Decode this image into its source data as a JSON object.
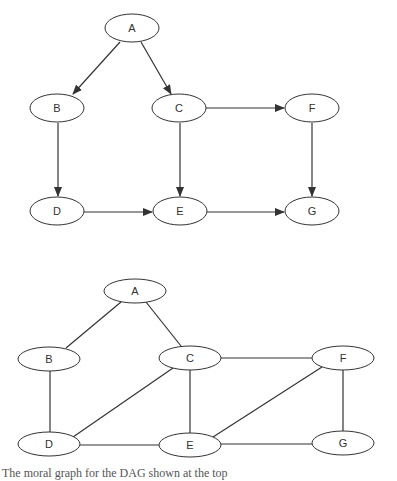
{
  "diagrams": [
    {
      "id": "dag",
      "type": "directed",
      "title": "DAG",
      "nodes": [
        {
          "label": "A",
          "cx": 132,
          "cy": 28,
          "rx": 27,
          "ry": 14
        },
        {
          "label": "B",
          "cx": 57,
          "cy": 108,
          "rx": 27,
          "ry": 14
        },
        {
          "label": "C",
          "cx": 179,
          "cy": 108,
          "rx": 27,
          "ry": 14
        },
        {
          "label": "F",
          "cx": 312,
          "cy": 108,
          "rx": 27,
          "ry": 14
        },
        {
          "label": "D",
          "cx": 57,
          "cy": 211,
          "rx": 27,
          "ry": 14
        },
        {
          "label": "E",
          "cx": 180,
          "cy": 211,
          "rx": 27,
          "ry": 14
        },
        {
          "label": "G",
          "cx": 312,
          "cy": 211,
          "rx": 27,
          "ry": 14
        }
      ],
      "edges": [
        {
          "from": "A",
          "to": "B",
          "x1": 120,
          "y1": 42,
          "x2": 73,
          "y2": 94
        },
        {
          "from": "A",
          "to": "C",
          "x1": 141,
          "y1": 42,
          "x2": 171,
          "y2": 94
        },
        {
          "from": "B",
          "to": "D",
          "x1": 58,
          "y1": 123,
          "x2": 58,
          "y2": 196
        },
        {
          "from": "C",
          "to": "E",
          "x1": 180,
          "y1": 123,
          "x2": 180,
          "y2": 196
        },
        {
          "from": "C",
          "to": "F",
          "x1": 206,
          "y1": 108,
          "x2": 284,
          "y2": 108
        },
        {
          "from": "F",
          "to": "G",
          "x1": 312,
          "y1": 123,
          "x2": 312,
          "y2": 196
        },
        {
          "from": "D",
          "to": "E",
          "x1": 84,
          "y1": 212,
          "x2": 152,
          "y2": 212
        },
        {
          "from": "E",
          "to": "G",
          "x1": 207,
          "y1": 212,
          "x2": 284,
          "y2": 212
        }
      ]
    },
    {
      "id": "moral-graph",
      "type": "undirected",
      "title": "Moral graph",
      "nodes": [
        {
          "label": "A",
          "cx": 135,
          "cy": 291,
          "rx": 31,
          "ry": 12
        },
        {
          "label": "B",
          "cx": 49,
          "cy": 359,
          "rx": 31,
          "ry": 12
        },
        {
          "label": "C",
          "cx": 190,
          "cy": 358,
          "rx": 31,
          "ry": 12
        },
        {
          "label": "F",
          "cx": 343,
          "cy": 358,
          "rx": 31,
          "ry": 12
        },
        {
          "label": "D",
          "cx": 49,
          "cy": 444,
          "rx": 31,
          "ry": 12
        },
        {
          "label": "E",
          "cx": 190,
          "cy": 445,
          "rx": 31,
          "ry": 12
        },
        {
          "label": "G",
          "cx": 343,
          "cy": 443,
          "rx": 31,
          "ry": 12
        }
      ],
      "edges": [
        {
          "from": "A",
          "to": "B",
          "x1": 121,
          "y1": 302,
          "x2": 66,
          "y2": 348
        },
        {
          "from": "A",
          "to": "C",
          "x1": 146,
          "y1": 302,
          "x2": 181,
          "y2": 346
        },
        {
          "from": "B",
          "to": "D",
          "x1": 50,
          "y1": 371,
          "x2": 50,
          "y2": 432
        },
        {
          "from": "C",
          "to": "D",
          "x1": 173,
          "y1": 368,
          "x2": 73,
          "y2": 437
        },
        {
          "from": "C",
          "to": "E",
          "x1": 190,
          "y1": 370,
          "x2": 190,
          "y2": 433
        },
        {
          "from": "C",
          "to": "F",
          "x1": 221,
          "y1": 358,
          "x2": 312,
          "y2": 358
        },
        {
          "from": "F",
          "to": "E",
          "x1": 322,
          "y1": 367,
          "x2": 213,
          "y2": 437
        },
        {
          "from": "F",
          "to": "G",
          "x1": 343,
          "y1": 370,
          "x2": 343,
          "y2": 431
        },
        {
          "from": "D",
          "to": "E",
          "x1": 80,
          "y1": 445,
          "x2": 159,
          "y2": 445
        },
        {
          "from": "E",
          "to": "G",
          "x1": 221,
          "y1": 444,
          "x2": 312,
          "y2": 444
        }
      ]
    }
  ],
  "caption": "The moral graph for the DAG shown at the top",
  "colors": {
    "stroke": "#333333",
    "background": "#ffffff",
    "text": "#333333"
  }
}
